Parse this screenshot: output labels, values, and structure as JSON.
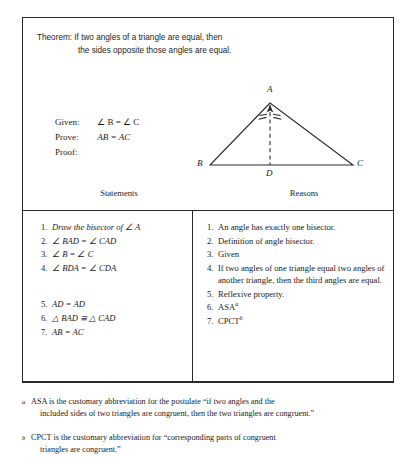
{
  "theorem": {
    "label": "Theorem:",
    "line1": "If two angles of a triangle are equal, then",
    "line2": "the sides opposite those angles are equal."
  },
  "given_block": {
    "given_label": "Given:",
    "given_value": "∠ B = ∠ C",
    "prove_label": "Prove:",
    "prove_value": "AB = AC",
    "proof_label": "Proof:"
  },
  "figure": {
    "vertex_a": "A",
    "vertex_b": "B",
    "vertex_c": "C",
    "vertex_d": "D",
    "stroke_color": "#2b2b2b"
  },
  "table": {
    "header_statements": "Statements",
    "header_reasons": "Reasons",
    "statements": [
      {
        "num": "1.",
        "text": "Draw the bisector of ∠ A"
      },
      {
        "num": "2.",
        "text": "∠ BAD = ∠ CAD"
      },
      {
        "num": "3.",
        "text": "∠ B = ∠ C"
      },
      {
        "num": "4.",
        "text": "∠ BDA = ∠ CDA"
      },
      {
        "num": "5.",
        "text": "AD = AD"
      },
      {
        "num": "6.",
        "text": "△ BAD ≅ △ CAD"
      },
      {
        "num": "7.",
        "text": "AB = AC"
      }
    ],
    "reasons": [
      {
        "num": "1.",
        "text": "An angle has exactly one bisector.",
        "sup": ""
      },
      {
        "num": "2.",
        "text": "Definition of angle bisector.",
        "sup": ""
      },
      {
        "num": "3.",
        "text": "Given",
        "sup": ""
      },
      {
        "num": "4.",
        "text": "If two angles of one triangle equal two angles of another triangle, then the third angles are equal.",
        "sup": ""
      },
      {
        "num": "5.",
        "text": "Reflexive property.",
        "sup": ""
      },
      {
        "num": "6.",
        "text": "ASA",
        "sup": "a"
      },
      {
        "num": "7.",
        "text": "CPCT",
        "sup": "b"
      }
    ]
  },
  "footnotes": [
    {
      "mark": "a",
      "line1": "ASA is the customary abbreviation for the postulate “if two angles and the",
      "line2": "included sides of two triangles are congruent, then the two triangles are congruent.”"
    },
    {
      "mark": "b",
      "line1": "CPCT is the customary abbreviation for “corresponding parts of congruent",
      "line2": "triangles are congruent.”"
    }
  ]
}
